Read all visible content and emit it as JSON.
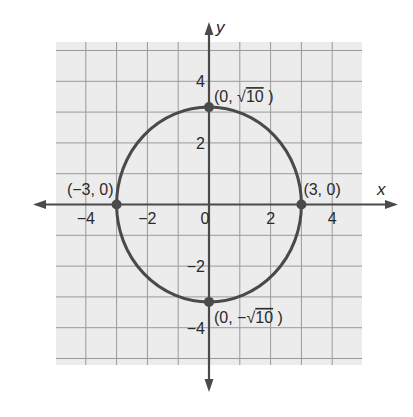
{
  "chart_data": {
    "type": "scatter",
    "title": "",
    "xlabel": "x",
    "ylabel": "y",
    "xlim": [
      -5,
      5
    ],
    "ylim": [
      -5,
      5
    ],
    "grid": true,
    "x_ticks": [
      {
        "value": -4,
        "label": "−4"
      },
      {
        "value": -2,
        "label": "−2"
      },
      {
        "value": 0,
        "label": "0"
      },
      {
        "value": 2,
        "label": "2"
      },
      {
        "value": 4,
        "label": "4"
      }
    ],
    "y_ticks": [
      {
        "value": 4,
        "label": "4"
      },
      {
        "value": 2,
        "label": "2"
      },
      {
        "value": -2,
        "label": "−2"
      },
      {
        "value": -4,
        "label": "−4"
      }
    ],
    "curve": {
      "kind": "ellipse",
      "equation": "x^2/9 + y^2/10 = 1",
      "center": [
        0,
        0
      ],
      "a": 3,
      "b": 3.1623,
      "color": "#4a4a4a"
    },
    "points": [
      {
        "x": 0,
        "y": 3.1623,
        "label_prefix": "(0, ",
        "label_radical": "10",
        "label_suffix": " )",
        "label_sign": ""
      },
      {
        "x": 0,
        "y": -3.1623,
        "label_prefix": "(0, ",
        "label_radical": "10",
        "label_suffix": " )",
        "label_sign": "−"
      },
      {
        "x": -3,
        "y": 0,
        "label": "(−3, 0)"
      },
      {
        "x": 3,
        "y": 0,
        "label": "(3, 0)"
      }
    ]
  },
  "colors": {
    "grid_bg": "#ececec",
    "grid_line": "#9a9a9a",
    "axis": "#4a4a4a",
    "curve": "#4a4a4a",
    "text": "#2a2a2a"
  }
}
